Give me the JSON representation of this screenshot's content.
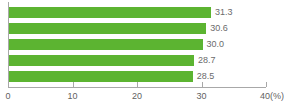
{
  "chart_data": {
    "type": "bar",
    "orientation": "horizontal",
    "title": "",
    "subtitle": "",
    "xlabel": "",
    "ylabel": "",
    "categories": [
      "",
      "",
      "",
      "",
      ""
    ],
    "values": [
      31.3,
      30.6,
      30.0,
      28.7,
      28.5
    ],
    "value_labels": [
      "31.3",
      "30.6",
      "30.0",
      "28.7",
      "28.5"
    ],
    "xlim": [
      0,
      40
    ],
    "xticks": [
      0,
      10,
      20,
      30,
      40
    ],
    "xtick_labels": [
      "0",
      "10",
      "20",
      "30",
      "40(%)"
    ],
    "unit_label": "(%)",
    "grid": false,
    "legend": null,
    "series": [
      {
        "name": "",
        "color": "#5cb431",
        "values": [
          31.3,
          30.6,
          30.0,
          28.7,
          28.5
        ]
      }
    ]
  },
  "colors": {
    "bar": "#5cb431",
    "axis": "#a8a8a8",
    "value_text": "#6b6b6b",
    "tick_text": "#5f5f5f",
    "background": "#ffffff"
  }
}
